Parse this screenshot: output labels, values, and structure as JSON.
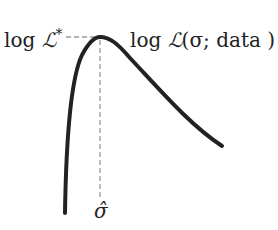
{
  "diagram": {
    "left_label": {
      "prefix": "log",
      "symbol": "ℒ",
      "superscript": "*"
    },
    "curve_label": {
      "prefix": "log",
      "symbol": "ℒ",
      "args": "(σ; data )"
    },
    "x_marker_label": "σ̂",
    "colors": {
      "curve": "#222222",
      "dashed": "#999999",
      "text": "#222222"
    }
  }
}
